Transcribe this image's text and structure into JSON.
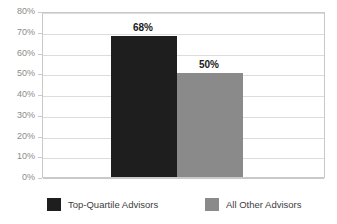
{
  "chart_data": {
    "type": "bar",
    "title": "",
    "subtitle": "",
    "xlabel": "",
    "ylabel": "",
    "categories": [
      "Top-Quartile Advisors",
      "All Other Advisors"
    ],
    "values": [
      68,
      50
    ],
    "value_labels": [
      "68%",
      "50%"
    ],
    "ylim": [
      0,
      80
    ],
    "ytick_labels": [
      "80%",
      "70%",
      "60%",
      "50%",
      "40%",
      "30%",
      "20%",
      "10%",
      "0%"
    ],
    "ytick_values": [
      80,
      70,
      60,
      50,
      40,
      30,
      20,
      10,
      0
    ],
    "grid": true,
    "legend_position": "bottom",
    "series": [
      {
        "name": "Top-Quartile Advisors",
        "value": 68,
        "label": "68%",
        "color": "#1e1e1e"
      },
      {
        "name": "All Other Advisors",
        "value": 50,
        "label": "50%",
        "color": "#8a8a8a"
      }
    ]
  },
  "legend": {
    "items": [
      {
        "label": "Top-Quartile Advisors",
        "color": "#1e1e1e"
      },
      {
        "label": "All Other Advisors",
        "color": "#8a8a8a"
      }
    ]
  },
  "colors": {
    "bar_dark": "#1e1e1e",
    "bar_gray": "#8a8a8a",
    "gridline": "#dcdcdc",
    "frame": "#c9c9c9",
    "tick_text": "#8c8c8c",
    "legend_text": "#3d3d3d",
    "background": "#ffffff"
  }
}
